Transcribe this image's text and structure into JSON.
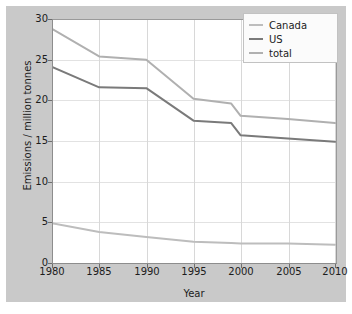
{
  "chart_data": {
    "type": "line",
    "title": "",
    "xlabel": "Year",
    "ylabel": "Emissions / million tonnes",
    "xlim": [
      1980,
      2010
    ],
    "ylim": [
      0,
      30
    ],
    "xticks": [
      "1980",
      "1985",
      "1990",
      "1995",
      "2000",
      "2005",
      "2010"
    ],
    "yticks": [
      "0",
      "5",
      "10",
      "15",
      "20",
      "25",
      "30"
    ],
    "grid": true,
    "legend_position": "top-right",
    "x": [
      1980,
      1985,
      1990,
      1995,
      1999,
      2000,
      2005,
      2010
    ],
    "series": [
      {
        "name": "total",
        "color": "#b0b0b0",
        "values": [
          28.8,
          25.4,
          25.0,
          20.2,
          19.6,
          18.1,
          17.7,
          17.2
        ]
      },
      {
        "name": "US",
        "color": "#7a7a7a",
        "values": [
          24.1,
          21.6,
          21.5,
          17.5,
          17.2,
          15.7,
          15.3,
          14.9
        ]
      },
      {
        "name": "Canada",
        "color": "#bdbdbd",
        "values": [
          4.9,
          3.8,
          3.2,
          2.6,
          2.45,
          2.4,
          2.4,
          2.25
        ]
      }
    ]
  },
  "legend": {
    "items": [
      {
        "label": "Canada",
        "color": "#bdbdbd"
      },
      {
        "label": "US",
        "color": "#7a7a7a"
      },
      {
        "label": "total",
        "color": "#b0b0b0"
      }
    ]
  },
  "axes": {
    "ylabel": "Emissions / million tonnes",
    "xlabel": "Year",
    "yticks": [
      "30",
      "25",
      "20",
      "15",
      "10",
      "5",
      "0"
    ],
    "xticks": [
      "1980",
      "1985",
      "1990",
      "1995",
      "2000",
      "2005",
      "2010"
    ]
  },
  "colors": {
    "figure_background": "#c9c9c9",
    "plot_background": "#ffffff",
    "axis": "#8d8d8d",
    "gridline": "#d8d8d8",
    "text": "#1c1c1c"
  }
}
